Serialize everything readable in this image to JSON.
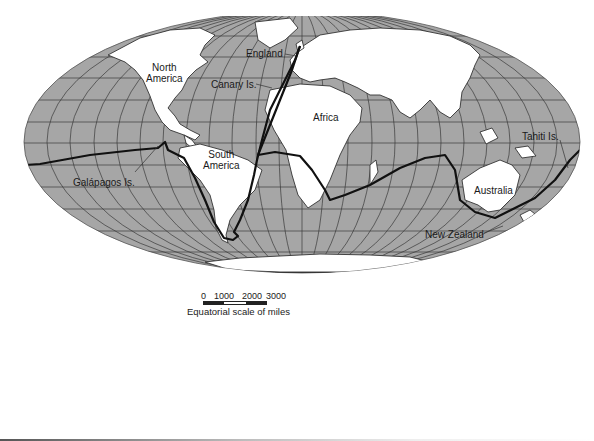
{
  "map": {
    "title": "Voyage route world map",
    "projection": "elliptical (Mollweide-style) world map with graticule",
    "colors": {
      "ocean": "#a6a6a6",
      "land": "#ffffff",
      "graticule": "#3a3a3a",
      "route": "#111111",
      "coastline": "#333333"
    },
    "labels": {
      "north_america": [
        "North",
        "America"
      ],
      "england": "England",
      "canary": "Canary Is.",
      "africa": "Africa",
      "south_america": [
        "South",
        "America"
      ],
      "galapagos": "Galápagos Is.",
      "tahiti": "Tahiti Is.",
      "australia": "Australia",
      "new_zealand": "New Zealand"
    }
  },
  "scale": {
    "ticks": [
      "0",
      "1000",
      "2000",
      "3000"
    ],
    "caption": "Equatorial scale of miles"
  }
}
